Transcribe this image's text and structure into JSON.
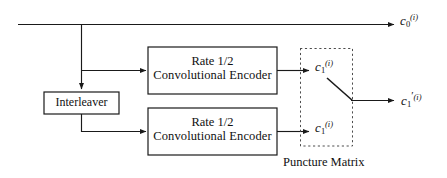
{
  "diagram": {
    "caption": "Puncture Matrix",
    "colors": {
      "line": "#1a1a1a",
      "box_border": "#1a1a1a",
      "background": "#ffffff",
      "dashed_border": "#4d4d4d"
    },
    "blocks": [
      {
        "id": "interleaver",
        "label": "Interleaver"
      },
      {
        "id": "encoder-top",
        "line1": "Rate 1/2",
        "line2": "Convolutional Encoder"
      },
      {
        "id": "encoder-bottom",
        "line1": "Rate 1/2",
        "line2": "Convolutional Encoder"
      }
    ],
    "signals": [
      {
        "id": "systematic-output",
        "base": "c",
        "sub": "0",
        "sup": "(i)",
        "prime": ""
      },
      {
        "id": "parity-top",
        "base": "c",
        "sub": "1",
        "sup": "(i)",
        "prime": ""
      },
      {
        "id": "parity-bottom",
        "base": "c",
        "sub": "1",
        "sup": "(i)",
        "prime": ""
      },
      {
        "id": "punctured-output",
        "base": "c",
        "sub": "1",
        "sup": "(i)",
        "prime": "′"
      }
    ]
  }
}
